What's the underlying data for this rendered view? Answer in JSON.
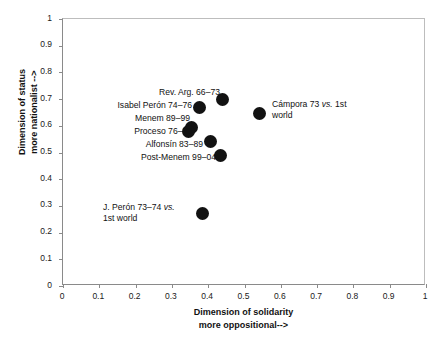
{
  "chart_data": {
    "type": "scatter",
    "title": "",
    "xlabel": "Dimension of solidarity more oppositional-->",
    "ylabel": "Dimension of status more nationalist -->",
    "xlabel_line1": "Dimension of solidarity",
    "xlabel_line2": "more oppositional-->",
    "ylabel_line1": "Dimension of status",
    "ylabel_line2": "more nationalist -->",
    "xlim": [
      0,
      1
    ],
    "ylim": [
      0,
      1
    ],
    "xticks": [
      "0",
      "0.1",
      "0.2",
      "0.3",
      "0.4",
      "0.5",
      "0.6",
      "0.7",
      "0.8",
      "0.9",
      "1"
    ],
    "yticks": [
      "0",
      "0.1",
      "0.2",
      "0.3",
      "0.4",
      "0.5",
      "0.6",
      "0.7",
      "0.8",
      "0.9",
      "1"
    ],
    "grid": false,
    "legend": "none",
    "marker_color": "#121212",
    "points": [
      {
        "label": "Rev. Arg. 66–73",
        "x": 0.44,
        "y": 0.7,
        "label_side": "left"
      },
      {
        "label": "Cámpora 73 vs. 1st world",
        "x": 0.54,
        "y": 0.645,
        "label_side": "right"
      },
      {
        "label": "Isabel Perón 74–76",
        "x": 0.375,
        "y": 0.67,
        "label_side": "left"
      },
      {
        "label": "Menem 89–99",
        "x": 0.355,
        "y": 0.595,
        "label_side": "left"
      },
      {
        "label": "Proceso 76–83",
        "x": 0.345,
        "y": 0.58,
        "label_side": "left"
      },
      {
        "label": "Alfonsín 83–89",
        "x": 0.405,
        "y": 0.54,
        "label_side": "left"
      },
      {
        "label": "Post-Menem 99–04",
        "x": 0.435,
        "y": 0.49,
        "label_side": "left"
      },
      {
        "label": "J. Perón 73–74 vs. 1st world",
        "x": 0.385,
        "y": 0.27,
        "label_side": "left"
      }
    ]
  },
  "labels": {
    "rev_arg": "Rev. Arg. 66–73",
    "isabel_peron": "Isabel Perón 74–76",
    "menem": "Menem 89–99",
    "proceso": "Proceso 76–83",
    "alfonsin": "Alfonsín 83–89",
    "post_menem": "Post-Menem 99–04",
    "campora_main": "Cámpora 73 ",
    "campora_vs": "vs.",
    "campora_tail": " 1st",
    "campora_line2": "world",
    "jperon_main": "J. Perón 73–74 ",
    "jperon_vs": "vs.",
    "jperon_line2": "1st world"
  },
  "axis": {
    "x_title_line1": "Dimension of solidarity",
    "x_title_line2": "more oppositional-->",
    "y_title_line1": "Dimension of status",
    "y_title_line2": "more nationalist -->"
  }
}
